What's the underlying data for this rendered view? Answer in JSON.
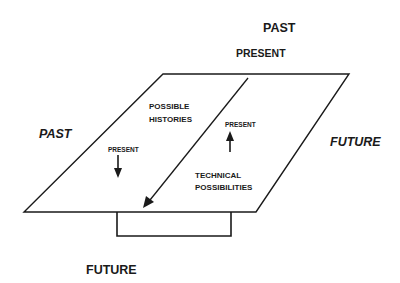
{
  "diagram": {
    "type": "conceptual-diagram",
    "colors": {
      "background": "#ffffff",
      "ink": "#1a1a1a"
    },
    "outer_labels": {
      "top_past": "PAST",
      "top_present": "PRESENT",
      "left_past": "PAST",
      "right_future": "FUTURE",
      "bottom_future": "FUTURE"
    },
    "plane": {
      "left_region": {
        "title_line1": "POSSIBLE",
        "title_line2": "HISTORIES",
        "arrow_label": "PRESENT",
        "arrow_direction": "down"
      },
      "right_region": {
        "arrow_label": "PRESENT",
        "arrow_direction": "up",
        "title_line1": "TECHNICAL",
        "title_line2": "POSSIBILITIES"
      },
      "divider_arrow_direction": "down-left"
    }
  }
}
